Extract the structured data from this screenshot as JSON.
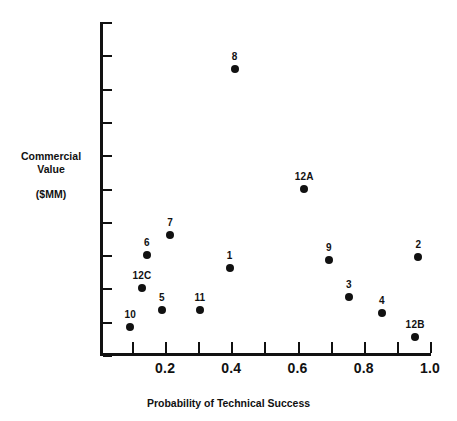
{
  "chart_data": {
    "type": "scatter",
    "title": "",
    "xlabel": "Probability of Technical Success",
    "ylabel": "Commercial Value",
    "ylabel_unit": "($MM)",
    "xlim": [
      0.05,
      1.0
    ],
    "ylim": [
      0,
      11
    ],
    "grid": false,
    "legend": "none",
    "xticks": [
      0.1,
      0.2,
      0.3,
      0.4,
      0.5,
      0.6,
      0.7,
      0.8,
      0.9,
      1.0
    ],
    "xtick_labels": [
      "",
      "0.2",
      "",
      "0.4",
      "",
      "0.6",
      "",
      "0.8",
      "",
      "1.0"
    ],
    "ytick_count": 11,
    "ytick_labels": [],
    "points": [
      {
        "label": "8",
        "x": 0.41,
        "y": 8.6,
        "label_dx": 0,
        "label_dy": -7
      },
      {
        "label": "12A",
        "x": 0.62,
        "y": 5.0,
        "label_dx": 0,
        "label_dy": -7
      },
      {
        "label": "7",
        "x": 0.215,
        "y": 3.6,
        "label_dx": 0,
        "label_dy": -7
      },
      {
        "label": "6",
        "x": 0.145,
        "y": 3.0,
        "label_dx": 0,
        "label_dy": -7
      },
      {
        "label": "2",
        "x": 0.965,
        "y": 2.95,
        "label_dx": 0,
        "label_dy": -7
      },
      {
        "label": "9",
        "x": 0.695,
        "y": 2.85,
        "label_dx": 0,
        "label_dy": -7
      },
      {
        "label": "1",
        "x": 0.395,
        "y": 2.6,
        "label_dx": 0,
        "label_dy": -7
      },
      {
        "label": "12C",
        "x": 0.13,
        "y": 2.0,
        "label_dx": 0,
        "label_dy": -7
      },
      {
        "label": "3",
        "x": 0.755,
        "y": 1.75,
        "label_dx": 0,
        "label_dy": -7
      },
      {
        "label": "5",
        "x": 0.19,
        "y": 1.35,
        "label_dx": 0,
        "label_dy": -7
      },
      {
        "label": "11",
        "x": 0.305,
        "y": 1.35,
        "label_dx": 0,
        "label_dy": -7
      },
      {
        "label": "4",
        "x": 0.855,
        "y": 1.25,
        "label_dx": 0,
        "label_dy": -7
      },
      {
        "label": "10",
        "x": 0.095,
        "y": 0.85,
        "label_dx": 0,
        "label_dy": -7
      },
      {
        "label": "12B",
        "x": 0.955,
        "y": 0.55,
        "label_dx": 0,
        "label_dy": -7
      }
    ]
  },
  "axes": {
    "y_title_line1": "Commercial",
    "y_title_line2": "Value",
    "y_title_unit": "($MM)",
    "x_title": "Probability of Technical Success"
  },
  "colors": {
    "ink": "#111111",
    "background": "#ffffff"
  }
}
